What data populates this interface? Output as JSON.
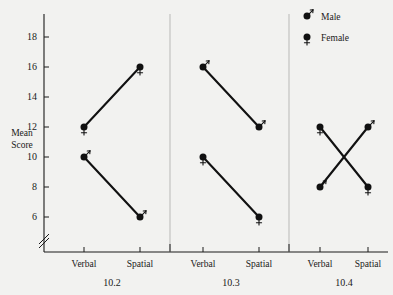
{
  "chart_data": {
    "type": "line",
    "title": "",
    "subtitle": "",
    "xlabel": "",
    "ylabel": "Mean Score",
    "ylabel_lines": [
      "Mean",
      "Score"
    ],
    "categories": [
      "Verbal",
      "Spatial"
    ],
    "yticks": [
      6,
      8,
      10,
      12,
      14,
      16,
      18
    ],
    "ylim": [
      5,
      19
    ],
    "y_axis_break": true,
    "grid": false,
    "legend_position": "top-right",
    "legend": [
      {
        "name": "Male",
        "symbol": "mars-symbol"
      },
      {
        "name": "Female",
        "symbol": "venus-symbol"
      }
    ],
    "panels": [
      {
        "label": "10.2",
        "series": [
          {
            "name": "Female",
            "symbol": "venus-symbol",
            "x": [
              "Verbal",
              "Spatial"
            ],
            "values": [
              12,
              16
            ]
          },
          {
            "name": "Male",
            "symbol": "mars-symbol",
            "x": [
              "Verbal",
              "Spatial"
            ],
            "values": [
              10,
              6
            ]
          }
        ]
      },
      {
        "label": "10.3",
        "series": [
          {
            "name": "Male",
            "symbol": "mars-symbol",
            "x": [
              "Verbal",
              "Spatial"
            ],
            "values": [
              16,
              12
            ]
          },
          {
            "name": "Female",
            "symbol": "venus-symbol",
            "x": [
              "Verbal",
              "Spatial"
            ],
            "values": [
              10,
              6
            ]
          }
        ]
      },
      {
        "label": "10.4",
        "series": [
          {
            "name": "Female",
            "symbol": "venus-symbol",
            "x": [
              "Verbal",
              "Spatial"
            ],
            "values": [
              12,
              8
            ]
          },
          {
            "name": "Male",
            "symbol": "mars-symbol",
            "x": [
              "Verbal",
              "Spatial"
            ],
            "values": [
              8,
              12
            ]
          }
        ]
      }
    ],
    "colors": {
      "background": "#f2f2f0",
      "ink": "#111111",
      "axis": "#1a1a1a",
      "divider": "#b9b9b7"
    }
  }
}
